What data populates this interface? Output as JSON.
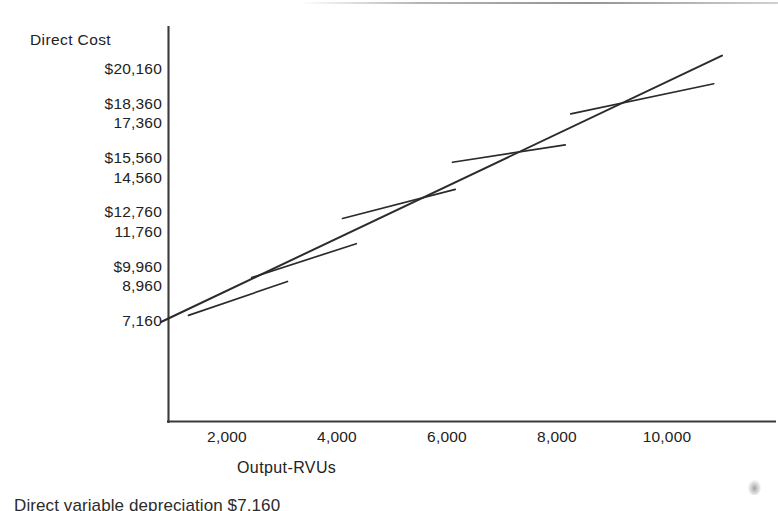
{
  "figure": {
    "y_axis_title": "Direct Cost",
    "x_axis_title": "Output-RVUs",
    "bottom_caption": "Direct variable depreciation  $7,160",
    "axis_color": "#3a3a3a",
    "line_color": "#2b2b2b"
  },
  "chart_data": {
    "type": "line",
    "title": "",
    "subtitle": "",
    "xlabel": "Output-RVUs",
    "ylabel": "Direct Cost",
    "grid": false,
    "legend": false,
    "legend_position": "none",
    "xlim": [
      0,
      11500
    ],
    "ylim": [
      0,
      21500
    ],
    "xticks": [
      2000,
      4000,
      6000,
      8000,
      10000
    ],
    "xtick_labels": [
      "2,000",
      "4,000",
      "6,000",
      "8,000",
      "10,000"
    ],
    "ytick_labels": [
      "$20,160",
      "$18,360",
      "17,360",
      "$15,560",
      "14,560",
      "$12,760",
      "11,760",
      "$9,960",
      "8,960",
      "7,160"
    ],
    "ytick_values": [
      20160,
      18360,
      17360,
      15560,
      14560,
      12760,
      11760,
      9960,
      8960,
      7160
    ],
    "series": [
      {
        "name": "Total direct cost line",
        "kind": "main-line",
        "x": [
          800,
          11000
        ],
        "y": [
          7160,
          20900
        ]
      },
      {
        "name": "Tangent segment 1",
        "kind": "tangent",
        "x": [
          1300,
          3100
        ],
        "y": [
          7500,
          9250
        ]
      },
      {
        "name": "Tangent segment 2",
        "kind": "tangent",
        "x": [
          2450,
          4350
        ],
        "y": [
          9450,
          11200
        ]
      },
      {
        "name": "Tangent segment 3",
        "kind": "tangent",
        "x": [
          4100,
          6150
        ],
        "y": [
          12500,
          14000
        ]
      },
      {
        "name": "Tangent segment 4",
        "kind": "tangent",
        "x": [
          6100,
          8150
        ],
        "y": [
          15400,
          16300
        ]
      },
      {
        "name": "Tangent segment 5",
        "kind": "tangent",
        "x": [
          8250,
          10850
        ],
        "y": [
          17900,
          19450
        ]
      }
    ],
    "annotations": []
  }
}
